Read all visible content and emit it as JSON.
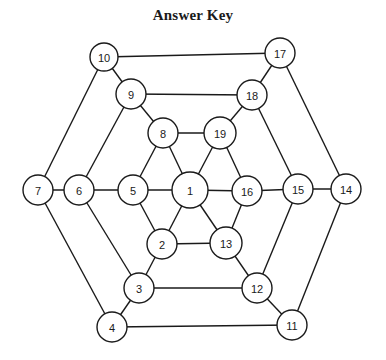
{
  "title": "Answer Key",
  "colors": {
    "stroke": "#1a1a1a",
    "node_fill": "#ffffff",
    "background": "#ffffff"
  },
  "nodes": [
    {
      "id": "1",
      "x": 190,
      "y": 190,
      "r": 18
    },
    {
      "id": "2",
      "x": 162,
      "y": 244,
      "r": 15
    },
    {
      "id": "3",
      "x": 139,
      "y": 288,
      "r": 15
    },
    {
      "id": "4",
      "x": 112,
      "y": 327,
      "r": 15
    },
    {
      "id": "5",
      "x": 133,
      "y": 190,
      "r": 15
    },
    {
      "id": "6",
      "x": 79,
      "y": 190,
      "r": 15
    },
    {
      "id": "7",
      "x": 38,
      "y": 190,
      "r": 15
    },
    {
      "id": "8",
      "x": 163,
      "y": 133,
      "r": 15
    },
    {
      "id": "9",
      "x": 131,
      "y": 94,
      "r": 15
    },
    {
      "id": "10",
      "x": 104,
      "y": 57,
      "r": 14
    },
    {
      "id": "11",
      "x": 292,
      "y": 325,
      "r": 15
    },
    {
      "id": "12",
      "x": 257,
      "y": 288,
      "r": 15
    },
    {
      "id": "13",
      "x": 226,
      "y": 243,
      "r": 16
    },
    {
      "id": "14",
      "x": 346,
      "y": 189,
      "r": 15
    },
    {
      "id": "15",
      "x": 298,
      "y": 189,
      "r": 15
    },
    {
      "id": "16",
      "x": 247,
      "y": 191,
      "r": 15
    },
    {
      "id": "17",
      "x": 280,
      "y": 53,
      "r": 15
    },
    {
      "id": "18",
      "x": 252,
      "y": 95,
      "r": 15
    },
    {
      "id": "19",
      "x": 220,
      "y": 133,
      "r": 16
    }
  ],
  "edges": [
    [
      "10",
      "17"
    ],
    [
      "17",
      "14"
    ],
    [
      "14",
      "11"
    ],
    [
      "11",
      "4"
    ],
    [
      "4",
      "7"
    ],
    [
      "7",
      "10"
    ],
    [
      "9",
      "18"
    ],
    [
      "18",
      "15"
    ],
    [
      "15",
      "12"
    ],
    [
      "12",
      "3"
    ],
    [
      "3",
      "6"
    ],
    [
      "6",
      "9"
    ],
    [
      "8",
      "19"
    ],
    [
      "19",
      "16"
    ],
    [
      "16",
      "13"
    ],
    [
      "13",
      "2"
    ],
    [
      "2",
      "5"
    ],
    [
      "5",
      "8"
    ],
    [
      "10",
      "9"
    ],
    [
      "9",
      "8"
    ],
    [
      "8",
      "1"
    ],
    [
      "17",
      "18"
    ],
    [
      "18",
      "19"
    ],
    [
      "19",
      "1"
    ],
    [
      "7",
      "6"
    ],
    [
      "6",
      "5"
    ],
    [
      "5",
      "1"
    ],
    [
      "14",
      "15"
    ],
    [
      "15",
      "16"
    ],
    [
      "16",
      "1"
    ],
    [
      "4",
      "3"
    ],
    [
      "3",
      "2"
    ],
    [
      "2",
      "1"
    ],
    [
      "11",
      "12"
    ],
    [
      "12",
      "13"
    ],
    [
      "13",
      "1"
    ]
  ]
}
